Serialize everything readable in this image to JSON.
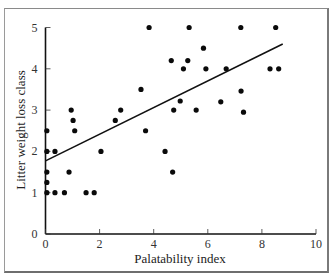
{
  "chart_data": {
    "type": "scatter",
    "title": "",
    "xlabel": "Palatability index",
    "ylabel": "Litter weight loss class",
    "xlim": [
      0,
      10
    ],
    "ylim": [
      0,
      5
    ],
    "xticks": [
      0,
      2,
      4,
      6,
      8,
      10
    ],
    "yticks": [
      0,
      1,
      2,
      3,
      4,
      5
    ],
    "xtick_labels": [
      "0",
      "2",
      "4",
      "6",
      "8",
      "10"
    ],
    "ytick_labels": [
      "0",
      "1",
      "2",
      "3",
      "4",
      "5"
    ],
    "grid": false,
    "legend": null,
    "points": [
      {
        "x": 0.05,
        "y": 2.5
      },
      {
        "x": 0.05,
        "y": 2.0
      },
      {
        "x": 0.35,
        "y": 2.0
      },
      {
        "x": 0.05,
        "y": 1.5
      },
      {
        "x": 0.05,
        "y": 1.25
      },
      {
        "x": 0.05,
        "y": 1.0
      },
      {
        "x": 0.35,
        "y": 1.0
      },
      {
        "x": 0.7,
        "y": 1.0
      },
      {
        "x": 1.5,
        "y": 1.0
      },
      {
        "x": 1.8,
        "y": 1.0
      },
      {
        "x": 0.87,
        "y": 1.5
      },
      {
        "x": 0.95,
        "y": 3.0
      },
      {
        "x": 1.02,
        "y": 2.75
      },
      {
        "x": 1.08,
        "y": 2.5
      },
      {
        "x": 2.05,
        "y": 2.0
      },
      {
        "x": 2.58,
        "y": 2.75
      },
      {
        "x": 2.78,
        "y": 3.0
      },
      {
        "x": 3.53,
        "y": 3.5
      },
      {
        "x": 3.7,
        "y": 2.5
      },
      {
        "x": 3.83,
        "y": 5.0
      },
      {
        "x": 4.42,
        "y": 2.0
      },
      {
        "x": 4.65,
        "y": 4.2
      },
      {
        "x": 4.7,
        "y": 1.5
      },
      {
        "x": 4.74,
        "y": 3.0
      },
      {
        "x": 4.98,
        "y": 3.22
      },
      {
        "x": 5.1,
        "y": 4.0
      },
      {
        "x": 5.26,
        "y": 4.2
      },
      {
        "x": 5.31,
        "y": 5.0
      },
      {
        "x": 5.57,
        "y": 3.0
      },
      {
        "x": 5.84,
        "y": 4.5
      },
      {
        "x": 5.93,
        "y": 4.0
      },
      {
        "x": 6.48,
        "y": 3.2
      },
      {
        "x": 6.68,
        "y": 4.0
      },
      {
        "x": 7.22,
        "y": 5.0
      },
      {
        "x": 7.23,
        "y": 3.46
      },
      {
        "x": 7.32,
        "y": 2.95
      },
      {
        "x": 8.3,
        "y": 4.0
      },
      {
        "x": 8.51,
        "y": 5.0
      },
      {
        "x": 8.62,
        "y": 4.0
      }
    ],
    "regression_line": {
      "x": [
        0,
        8.77
      ],
      "y": [
        1.77,
        4.6
      ]
    }
  }
}
